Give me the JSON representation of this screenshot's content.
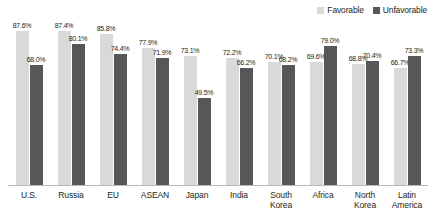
{
  "legend": {
    "entries": [
      {
        "label": "Favorable",
        "color": "#d9d9d9"
      },
      {
        "label": "Unfavorable",
        "color": "#575757"
      }
    ]
  },
  "chart_data": {
    "type": "bar",
    "title": "",
    "subtitle": "",
    "xlabel": "",
    "ylabel": "",
    "ylim": [
      0,
      100
    ],
    "grid": false,
    "legend_position": "top-right",
    "value_format": "percent",
    "categories": [
      "U.S.",
      "Russia",
      "EU",
      "ASEAN",
      "Japan",
      "India",
      "South\nKorea",
      "Africa",
      "North\nKorea",
      "Latin\nAmerica"
    ],
    "series": [
      {
        "name": "Favorable",
        "color": "#d9d9d9",
        "values": [
          87.6,
          87.4,
          85.8,
          77.9,
          73.1,
          72.2,
          70.1,
          69.6,
          68.8,
          66.7
        ],
        "labels": [
          "87.6%",
          "87.4%",
          "85.8%",
          "77.9%",
          "73.1%",
          "72.2%",
          "70.1%",
          "69.6%",
          "68.8%",
          "66.7%"
        ]
      },
      {
        "name": "Unfavorable",
        "color": "#575757",
        "values": [
          68.0,
          80.1,
          74.4,
          71.9,
          49.5,
          66.2,
          68.2,
          79.0,
          70.4,
          73.3
        ],
        "labels": [
          "68.0%",
          "80.1%",
          "74.4%",
          "71.9%",
          "49.5%",
          "66.2%",
          "68.2%",
          "79.0%",
          "70.4%",
          "73.3%"
        ]
      }
    ]
  }
}
